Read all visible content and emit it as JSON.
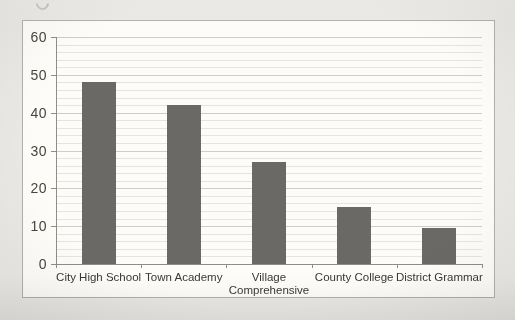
{
  "figure": {
    "background_color": "#eae8e4",
    "frame_background_color": "#fdfcf9",
    "frame_border_color": "#b2b0ac"
  },
  "chart_data": {
    "type": "bar",
    "title": "",
    "xlabel": "",
    "ylabel": "",
    "categories": [
      "City High School",
      "Town Academy",
      "Village Comprehensive",
      "County College",
      "District Grammar"
    ],
    "category_label_lines": [
      [
        "City High School"
      ],
      [
        "Town Academy"
      ],
      [
        "Village",
        "Comprehensive"
      ],
      [
        "County College"
      ],
      [
        "District Grammar"
      ]
    ],
    "values": [
      48,
      42,
      27,
      15,
      9.5
    ],
    "ylim": [
      0,
      60
    ],
    "yticks": [
      0,
      10,
      20,
      30,
      40,
      50,
      60
    ],
    "ytick_labels": [
      "0",
      "10",
      "20",
      "30",
      "40",
      "50",
      "60"
    ],
    "minor_grid_step": 2,
    "grid": true,
    "legend_position": "none",
    "bar_color": "#6a6966",
    "minor_gridline_color": "#e6e4e0",
    "major_gridline_color": "#cfcdc8",
    "axis_color": "#8f8d88",
    "tick_label_color": "#47453e",
    "category_label_color": "#3a3833"
  }
}
